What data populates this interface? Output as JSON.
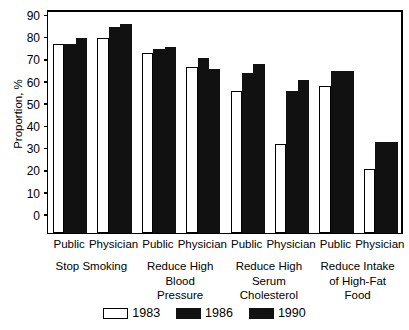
{
  "chart_data": {
    "type": "bar",
    "title": "",
    "xlabel": "",
    "ylabel": "Proportion, %",
    "ylim": [
      0,
      100
    ],
    "ytick_labels": [
      "100",
      "90",
      "80",
      "70",
      "60",
      "50",
      "40",
      "30",
      "20",
      "10",
      "0"
    ],
    "ytick_values": [
      100,
      90,
      80,
      70,
      60,
      50,
      40,
      30,
      20,
      10,
      0
    ],
    "grid": false,
    "legend_position": "bottom-center",
    "series": [
      {
        "name": "1983",
        "color": "#ffffff",
        "values": [
          85,
          88,
          81,
          75,
          64,
          40,
          66,
          29
        ]
      },
      {
        "name": "1986",
        "color": "#111111",
        "values": [
          85,
          93,
          83,
          79,
          72,
          64,
          73,
          41
        ]
      },
      {
        "name": "1990",
        "color": "#111111",
        "values": [
          88,
          94,
          84,
          74,
          76,
          69,
          73,
          41
        ]
      }
    ],
    "categories": [
      "Public",
      "Physician",
      "Public",
      "Physician",
      "Public",
      "Physician",
      "Public",
      "Physician"
    ],
    "group_labels": [
      "Stop Smoking",
      "Reduce High\nBlood\nPressure",
      "Reduce High\nSerum\nCholesterol",
      "Reduce Intake\nof High-Fat\nFood"
    ]
  },
  "legend": {
    "items": [
      {
        "label": "1983"
      },
      {
        "label": "1986"
      },
      {
        "label": "1990"
      }
    ]
  }
}
